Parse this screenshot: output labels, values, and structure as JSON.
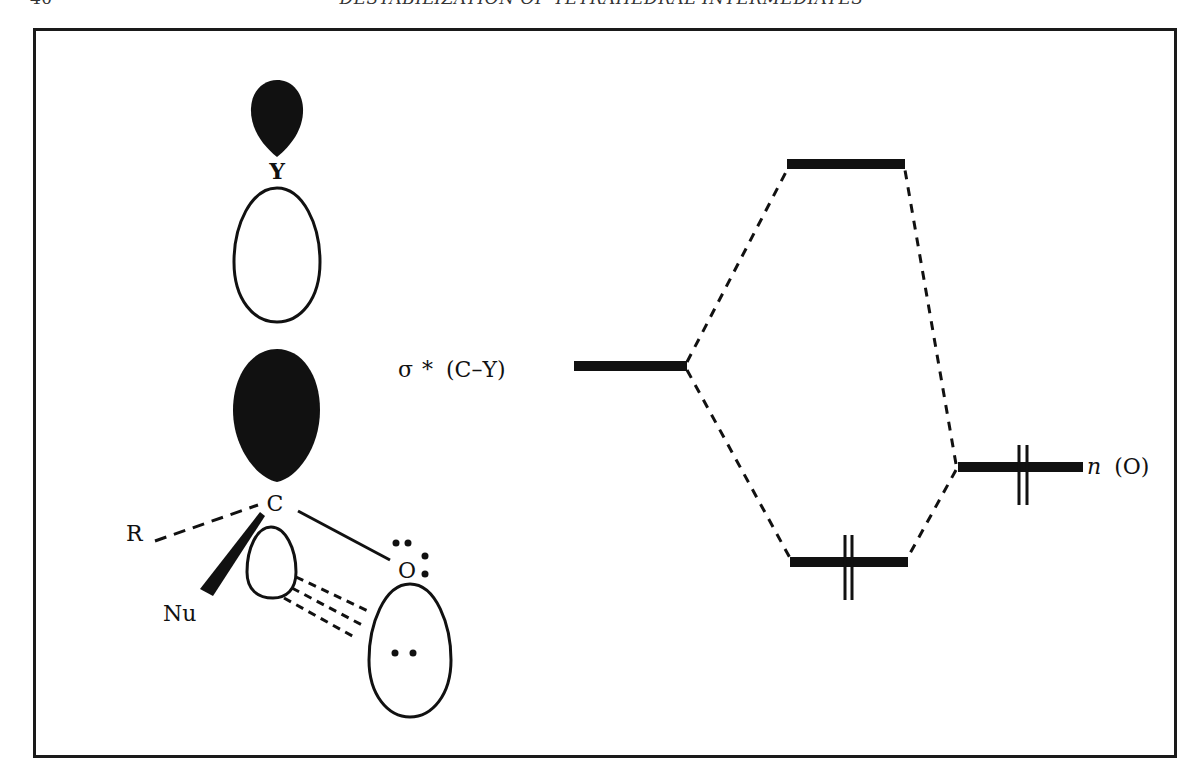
{
  "running_header": {
    "page_number": "40",
    "chapter_title": "DESTABILIZATION OF TETRAHEDRAL INTERMEDIATES"
  },
  "figure": {
    "type": "orbital-interaction-diagram",
    "left_panel": {
      "atom_labels": {
        "leaving_group": "Y",
        "central_carbon": "C",
        "substituent_r": "R",
        "nucleophile": "Nu",
        "oxygen": "O"
      },
      "description": "C–Y sigma* orbital lobes aligned antiperiplanar to oxygen lone pair; dashed lines show overlap of the carbon back-lobe with the oxygen n orbital"
    },
    "energy_diagram": {
      "levels": [
        {
          "id": "antibonding-combination",
          "label": "",
          "electrons": 0
        },
        {
          "id": "sigma-star-c-y",
          "label_symbol": "σ",
          "label_star": "*",
          "label_bond": "(C–Y)",
          "electrons": 0
        },
        {
          "id": "n-oxygen",
          "label_italic": "n",
          "label_rest": "(O)",
          "electrons": 2
        },
        {
          "id": "bonding-combination",
          "label": "",
          "electrons": 2
        }
      ]
    }
  },
  "colors": {
    "ink": "#111111",
    "paper": "#ffffff",
    "frame": "#1a1a1a"
  }
}
